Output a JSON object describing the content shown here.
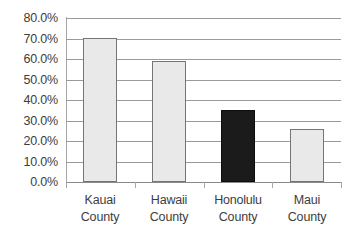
{
  "chart_data": {
    "type": "bar",
    "title": "",
    "subtitle": "",
    "xlabel": "",
    "ylabel": "",
    "categories": [
      "Kauai County",
      "Hawaii County",
      "Honolulu County",
      "Maui County"
    ],
    "category_lines": [
      [
        "Kauai",
        "County"
      ],
      [
        "Hawaii",
        "County"
      ],
      [
        "Honolulu",
        "County"
      ],
      [
        "Maui",
        "County"
      ]
    ],
    "values": [
      70.2,
      59.0,
      35.2,
      26.0
    ],
    "value_labels": [
      "70.2%",
      "59.0%",
      "35.2%",
      "26.0%"
    ],
    "highlighted_index": 2,
    "ylim": [
      0,
      80
    ],
    "ytick_values": [
      0,
      10,
      20,
      30,
      40,
      50,
      60,
      70,
      80
    ],
    "ytick_labels": [
      "0.0%",
      "10.0%",
      "20.0%",
      "30.0%",
      "40.0%",
      "50.0%",
      "60.0%",
      "70.0%",
      "80.0%"
    ],
    "grid": true,
    "grid_axis": "y",
    "legend": false,
    "legend_position": "none",
    "bar_colors": [
      "#e9e9e9",
      "#e9e9e9",
      "#1b1b1b",
      "#e9e9e9"
    ],
    "bar_border_colors": [
      "#757575",
      "#757575",
      "#0d0d0d",
      "#757575"
    ]
  },
  "style": {
    "background": "#ffffff",
    "gridline_color": "#9a9a9a",
    "axis_color": "#a6a6a6",
    "text_color": "#3d3d3d",
    "light_bar_fill": "#e9e9e9",
    "dark_bar_fill": "#1b1b1b"
  }
}
